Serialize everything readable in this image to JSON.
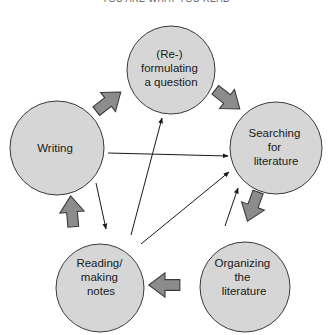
{
  "header": {
    "text": "YOU ARE WHAT YOU READ"
  },
  "colors": {
    "circle_fill": "#d6d6d6",
    "circle_stroke": "#3a3a3a",
    "block_arrow_fill": "#8c8c8c",
    "block_arrow_stroke": "#3a3a3a",
    "line_arrow": "#1a1a1a"
  },
  "nodes": [
    {
      "id": "question",
      "lines": [
        "(Re-)",
        "formulating",
        "a question"
      ]
    },
    {
      "id": "searching",
      "lines": [
        "Searching",
        "for",
        "literature"
      ]
    },
    {
      "id": "organizing",
      "lines": [
        "Organizing",
        "the",
        "literature"
      ]
    },
    {
      "id": "reading",
      "lines": [
        "Reading/",
        "making",
        "notes"
      ]
    },
    {
      "id": "writing",
      "lines": [
        "Writing"
      ]
    }
  ],
  "cycle_arrows": [
    {
      "from": "question",
      "to": "searching"
    },
    {
      "from": "searching",
      "to": "organizing"
    },
    {
      "from": "organizing",
      "to": "reading"
    },
    {
      "from": "reading",
      "to": "writing"
    },
    {
      "from": "writing",
      "to": "question"
    }
  ],
  "thin_arrows": [
    {
      "from": "writing",
      "to": "searching"
    },
    {
      "from": "writing",
      "to": "reading"
    },
    {
      "from": "reading",
      "to": "question"
    },
    {
      "from": "reading",
      "to": "searching"
    },
    {
      "from": "organizing",
      "to": "searching"
    }
  ]
}
